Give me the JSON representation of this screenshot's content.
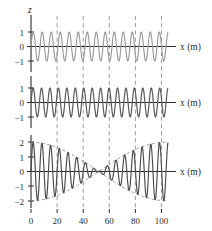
{
  "figure": {
    "background": "#ffffff",
    "axis_color": "#2b2b2b",
    "grid_color": "#8f8f8f",
    "wave1_color": "#9a9a9a",
    "wave2_color": "#5a5a5a",
    "sum_color": "#4a4a4a",
    "envelope_color": "#8f8f8f",
    "y_axis_title": "z",
    "x_axis_label": "x (m)",
    "x_ticks": [
      0,
      20,
      40,
      60,
      80,
      100
    ],
    "x_tick_labels": [
      "0",
      "20",
      "40",
      "60",
      "80",
      "100"
    ],
    "xlim": [
      0,
      105
    ],
    "gridlines": [
      20,
      40,
      60,
      80,
      100
    ]
  },
  "chart_data": {
    "type": "line",
    "title": "",
    "xlabel": "x (m)",
    "ylabel": "z",
    "xlim": [
      0,
      105
    ],
    "grid": true,
    "legend": "none",
    "panels": [
      {
        "name": "wave-1",
        "y_ticks": [
          1,
          0,
          -1
        ],
        "y_tick_labels": [
          "1",
          "0",
          "−1"
        ],
        "ylim": [
          -1.45,
          1.45
        ],
        "x_axis_label": "x (m)",
        "y_axis_title": "z",
        "series": [
          {
            "name": "wave 1",
            "color": "#9a9a9a",
            "amplitude": 1.0,
            "wavelength": 6.9,
            "wavenumber": 0.9106,
            "phase": 0.0,
            "form": "z = A sin(k x)",
            "cycles_visible": 15.2
          }
        ]
      },
      {
        "name": "wave-2",
        "y_ticks": [
          1,
          0,
          -1
        ],
        "y_tick_labels": [
          "1",
          "0",
          "−1"
        ],
        "ylim": [
          -1.45,
          1.45
        ],
        "x_axis_label": "x (m)",
        "series": [
          {
            "name": "wave 2",
            "color": "#5a5a5a",
            "amplitude": 1.0,
            "wavelength": 6.47,
            "wavenumber": 0.9712,
            "phase": 0.0,
            "form": "z = A sin(k x)",
            "cycles_visible": 16.2
          }
        ]
      },
      {
        "name": "superposition-beats",
        "y_ticks": [
          2,
          1,
          0,
          -1,
          -2
        ],
        "y_tick_labels": [
          "2",
          "1",
          "0",
          "−1",
          "−2"
        ],
        "ylim": [
          -2.4,
          2.4
        ],
        "x_axis_label": "x (m)",
        "series": [
          {
            "name": "sum of wave 1 and wave 2",
            "color": "#4a4a4a",
            "amplitude": 2.0,
            "form": "z = 2A cos(Δk x / 2) sin(k̅ x)",
            "beat_nodes": [
              30,
              90
            ],
            "beat_antinodes": [
              0,
              60
            ],
            "beat_wavelength": 120
          },
          {
            "name": "envelope",
            "color": "#8f8f8f",
            "style": "dashed",
            "amplitude": 2.0,
            "form": "±2A cos(Δk x / 2)"
          }
        ]
      }
    ]
  }
}
